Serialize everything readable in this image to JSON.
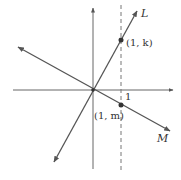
{
  "diagram": {
    "type": "coordinate-plane-lines",
    "labels": {
      "line_L": "L",
      "line_M": "M",
      "point_k": "(1, k)",
      "point_m": "(1, m)",
      "x_tick": "1"
    },
    "colors": {
      "stroke": "#555555",
      "point": "#333333"
    },
    "elements": {
      "x_axis": "horizontal axis with arrow",
      "y_axis": "vertical axis with arrow",
      "dashed_line": "vertical dashed line x = 1",
      "line_L": "line through origin with positive slope, passes (1, k)",
      "line_M": "line through origin with negative slope, passes (1, m)"
    }
  }
}
